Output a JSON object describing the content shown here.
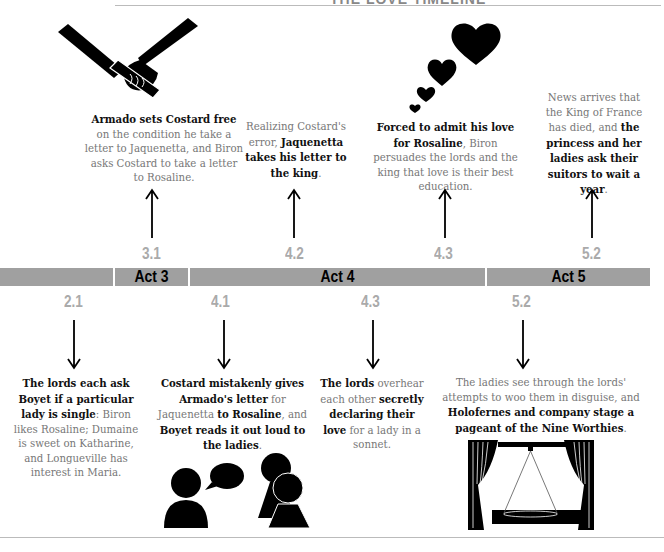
{
  "header": {
    "title": "THE LOVE TIMELINE"
  },
  "acts": [
    {
      "label": ""
    },
    {
      "label": "Act 3"
    },
    {
      "label": "Act 4"
    },
    {
      "label": "Act 5"
    }
  ],
  "top_events": [
    {
      "scene": "3.1",
      "icon": "baton-hand-icon",
      "segments": [
        {
          "t": "Armado sets Costard free",
          "b": true
        },
        {
          "t": " on the condition he take a letter to Jaquenetta, and Biron asks Costard to take a letter to Rosaline.",
          "b": false
        }
      ]
    },
    {
      "scene": "4.2",
      "icon": "",
      "segments": [
        {
          "t": "Realizing Costard's error, ",
          "b": false
        },
        {
          "t": "Jaquenetta takes his letter to the king",
          "b": true
        },
        {
          "t": ".",
          "b": false
        }
      ]
    },
    {
      "scene": "4.3",
      "icon": "hearts-icon",
      "segments": [
        {
          "t": "Forced to admit his love for Rosaline",
          "b": true
        },
        {
          "t": ", Biron persuades the lords and the king that love is their best education.",
          "b": false
        }
      ]
    },
    {
      "scene": "5.2",
      "icon": "",
      "segments": [
        {
          "t": "News arrives that the King of France has died, and ",
          "b": false
        },
        {
          "t": "the princess and her ladies ask their suitors to wait a year",
          "b": true
        },
        {
          "t": ".",
          "b": false
        }
      ]
    }
  ],
  "bottom_events": [
    {
      "scene": "2.1",
      "icon": "",
      "segments": [
        {
          "t": "The lords each ask Boyet if a particular lady is single",
          "b": true
        },
        {
          "t": ": Biron likes Rosaline; Dumaine is sweet on Katharine, and Longueville has interest in Maria.",
          "b": false
        }
      ]
    },
    {
      "scene": "4.1",
      "icon": "conversation-icon",
      "segments": [
        {
          "t": "Costard mistakenly gives Armado's letter",
          "b": true
        },
        {
          "t": " for Jaquenetta ",
          "b": false
        },
        {
          "t": "to Rosaline",
          "b": true
        },
        {
          "t": ", and ",
          "b": false
        },
        {
          "t": "Boyet reads it out loud to the ladies",
          "b": true
        },
        {
          "t": ".",
          "b": false
        }
      ]
    },
    {
      "scene": "4.3",
      "icon": "",
      "segments": [
        {
          "t": "The lords",
          "b": true
        },
        {
          "t": " overhear each other ",
          "b": false
        },
        {
          "t": "secretly declaring their love",
          "b": true
        },
        {
          "t": " for a lady in a sonnet.",
          "b": false
        }
      ]
    },
    {
      "scene": "5.2",
      "icon": "stage-icon",
      "segments": [
        {
          "t": "The ladies see through the lords' attempts to woo them in disguise, and ",
          "b": false
        },
        {
          "t": "Holofernes and company stage a pageant of the Nine Worthies",
          "b": true
        },
        {
          "t": ".",
          "b": false
        }
      ]
    }
  ],
  "colors": {
    "bar": "#a0a0a0",
    "scene_number": "#aaaaaa",
    "body_text": "#777777",
    "bold_text": "#111111"
  }
}
